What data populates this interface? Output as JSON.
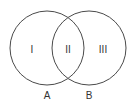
{
  "diagram": {
    "type": "venn",
    "stroke_color": "#4a4a4a",
    "text_color": "#333333",
    "sets": [
      {
        "label": "A",
        "cx": 47,
        "cy": 48,
        "r": 37,
        "label_x": 47,
        "label_y": 96
      },
      {
        "label": "B",
        "cx": 89,
        "cy": 48,
        "r": 37,
        "label_x": 89,
        "label_y": 96
      }
    ],
    "regions": [
      {
        "label": "I",
        "x": 32,
        "y": 50
      },
      {
        "label": "II",
        "x": 68,
        "y": 50
      },
      {
        "label": "III",
        "x": 103,
        "y": 50
      }
    ]
  }
}
